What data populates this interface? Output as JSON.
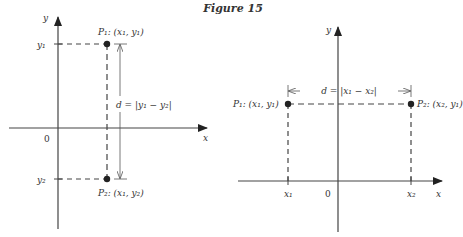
{
  "figure": {
    "title": "Figure 15"
  },
  "left_panel": {
    "axis_x_label": "x",
    "axis_y_label": "y",
    "origin_label": "0",
    "tick_y1": "y₁",
    "tick_y2": "y₂",
    "point1_label": "P₁: (x₁, y₁)",
    "point2_label": "P₂: (x₁, y₂)",
    "distance_label": "d = |y₁ − y₂|"
  },
  "right_panel": {
    "axis_x_label": "x",
    "axis_y_label": "y",
    "origin_label": "0",
    "tick_x1": "x₁",
    "tick_x2": "x₂",
    "point1_label": "P₁: (x₁, y₁)",
    "point2_label": "P₂: (x₂, y₁)",
    "distance_label": "d = |x₁ − x₂|"
  },
  "colors": {
    "ink": "#333333",
    "axis": "#444444"
  }
}
